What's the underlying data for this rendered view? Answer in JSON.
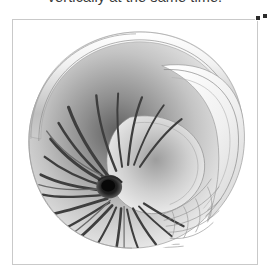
{
  "document": {
    "body_text_line": "vertically at the same time."
  },
  "figure": {
    "name": "nautilus-shell-cross-section",
    "alt_label": "Nautilus shell cut away showing spiral chambers",
    "selected": true,
    "frame_border_color": "#c9c9c9",
    "background_color": "#ffffff",
    "palette": {
      "shell_light": "#f7f7f7",
      "shell_mid": "#bdbdbd",
      "shell_dark": "#6e6e6e",
      "septa_dark": "#3a3a3a",
      "core_black": "#141414",
      "outline": "#8f8f8f"
    }
  },
  "selection": {
    "handle_color": "#2b2b2b",
    "handle_count": 2
  }
}
